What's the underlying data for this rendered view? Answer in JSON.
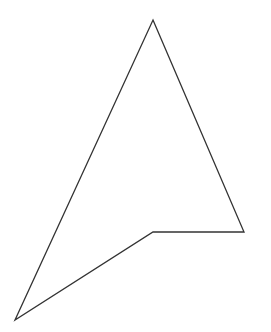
{
  "canvas": {
    "width": 271,
    "height": 332,
    "background": "#ffffff"
  },
  "shape": {
    "type": "polygon",
    "points": [
      [
        153,
        20
      ],
      [
        244,
        232
      ],
      [
        153,
        232
      ],
      [
        15,
        320
      ]
    ],
    "stroke": "#333333",
    "stroke_width": 1.3,
    "fill": "none"
  }
}
